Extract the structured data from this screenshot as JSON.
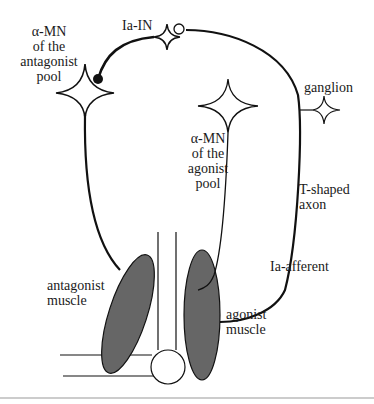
{
  "diagram": {
    "labels": {
      "antagonist_mn": [
        "α-MN",
        "of the",
        "antagonist",
        "pool"
      ],
      "ia_in": "Ia-IN",
      "ganglion": "ganglion",
      "agonist_mn": [
        "α-MN",
        "of the",
        "agonist",
        "pool"
      ],
      "t_axon": [
        "T-shaped",
        "axon"
      ],
      "ia_afferent": "Ia-afferent",
      "antagonist_muscle": [
        "antagonist",
        "muscle"
      ],
      "agonist_muscle": [
        "agonist",
        "muscle"
      ]
    },
    "colors": {
      "line": "#111111",
      "muscle_fill": "#666666",
      "background": "#ffffff",
      "rule": "#999999"
    },
    "nodes": [
      {
        "id": "antagonist-mn",
        "type": "star"
      },
      {
        "id": "ia-in",
        "type": "star"
      },
      {
        "id": "ganglion",
        "type": "star"
      },
      {
        "id": "agonist-mn",
        "type": "star"
      },
      {
        "id": "inhibitory-synapse",
        "type": "filled-circle"
      },
      {
        "id": "excitatory-synapse",
        "type": "open-circle"
      }
    ]
  }
}
